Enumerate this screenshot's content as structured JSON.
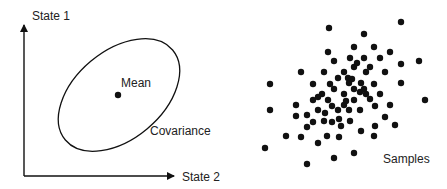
{
  "left_panel": {
    "y_axis_label": "State 1",
    "x_axis_label": "State 2",
    "mean_label": "Mean",
    "covariance_label": "Covariance"
  },
  "right_panel": {
    "samples_label": "Samples",
    "sample_count": 80
  },
  "colors": {
    "ink": "#111111",
    "text": "#222222",
    "background": "#ffffff"
  }
}
